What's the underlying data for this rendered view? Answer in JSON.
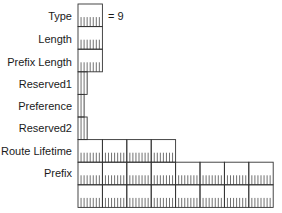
{
  "diagram": {
    "type": "packet-format",
    "byte_width_px": 24.4,
    "row_height_px": 22.6,
    "origin_x": 78,
    "origin_y": 4,
    "line_color": "#333333",
    "fields": [
      {
        "label": "Type",
        "bytes": 1,
        "rows": 1,
        "note": "= 9"
      },
      {
        "label": "Length",
        "bytes": 1,
        "rows": 1
      },
      {
        "label": "Prefix Length",
        "bytes": 1,
        "rows": 1
      },
      {
        "label": "Reserved1",
        "bits": 3,
        "rows": 1
      },
      {
        "label": "Preference",
        "bits": 2,
        "rows": 1
      },
      {
        "label": "Reserved2",
        "bits": 3,
        "rows": 1
      },
      {
        "label": "Route Lifetime",
        "bytes": 4,
        "rows": 1
      },
      {
        "label": "Prefix",
        "bytes": 8,
        "rows": 2
      }
    ]
  }
}
